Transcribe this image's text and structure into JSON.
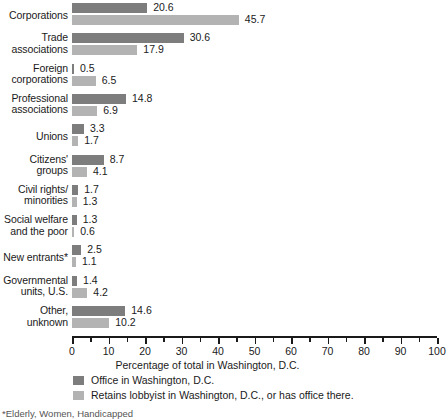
{
  "chart_data": {
    "type": "bar",
    "orientation": "horizontal",
    "title": "",
    "xlabel": "Percentage of total in Washington, D.C.",
    "ylabel": "",
    "xlim": [
      0,
      100
    ],
    "xticks": [
      0,
      10,
      20,
      30,
      40,
      50,
      60,
      70,
      80,
      90,
      100
    ],
    "minor_tick_step": 5,
    "grid": false,
    "legend_position": "bottom-left",
    "categories": [
      "Corporations",
      "Trade\nassociations",
      "Foreign\ncorporations",
      "Professional\nassociations",
      "Unions",
      "Citizens'\ngroups",
      "Civil rights/\nminorities",
      "Social welfare\nand the poor",
      "New entrants*",
      "Governmental\nunits, U.S.",
      "Other,\nunknown"
    ],
    "series": [
      {
        "name": "Office in Washington, D.C.",
        "color": "#7d7d7d",
        "values": [
          20.6,
          30.6,
          0.5,
          14.8,
          3.3,
          8.7,
          1.7,
          1.3,
          2.5,
          1.4,
          14.6
        ]
      },
      {
        "name": "Retains lobbyist in Washington, D.C., or has office there.",
        "color": "#b3b3b3",
        "values": [
          45.7,
          17.9,
          6.5,
          6.9,
          1.7,
          4.1,
          1.3,
          0.6,
          1.1,
          4.2,
          10.2
        ]
      }
    ],
    "value_labels": [
      [
        "20.6",
        "45.7"
      ],
      [
        "30.6",
        "17.9"
      ],
      [
        "0.5",
        "6.5"
      ],
      [
        "14.8",
        "6.9"
      ],
      [
        "3.3",
        "1.7"
      ],
      [
        "8.7",
        "4.1"
      ],
      [
        "1.7",
        "1.3"
      ],
      [
        "1.3",
        "0.6"
      ],
      [
        "2.5",
        "1.1"
      ],
      [
        "1.4",
        "4.2"
      ],
      [
        "14.6",
        "10.2"
      ]
    ],
    "tick_labels": [
      "0",
      "10",
      "20",
      "30",
      "40",
      "50",
      "60",
      "70",
      "80",
      "90",
      "100"
    ],
    "footnote": "*Elderly, Women, Handicapped"
  },
  "legend": {
    "items": [
      {
        "label": "Office in Washington, D.C.",
        "color": "#7d7d7d"
      },
      {
        "label": "Retains lobbyist in Washington, D.C., or has office there.",
        "color": "#b3b3b3"
      }
    ]
  }
}
